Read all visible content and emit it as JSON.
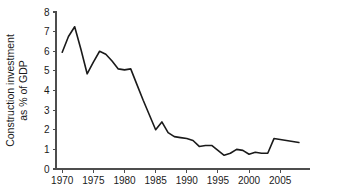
{
  "chart_data": {
    "type": "line",
    "title": "",
    "xlabel": "",
    "ylabel": "Construction investment as % of GDP",
    "ylabel_line1": "Construction investment",
    "ylabel_line2": "as % of GDP",
    "xlim": [
      1969,
      2008.5
    ],
    "ylim": [
      0,
      8
    ],
    "grid": false,
    "legend": "none",
    "ytick_labels": [
      "8",
      "7",
      "6",
      "5",
      "4",
      "3",
      "2",
      "1",
      "0"
    ],
    "ytick_values": [
      8,
      7,
      6,
      5,
      4,
      3,
      2,
      1,
      0
    ],
    "xtick_labels": [
      "1970",
      "1975",
      "1980",
      "1985",
      "1990",
      "1995",
      "2000",
      "2005"
    ],
    "xtick_values": [
      1970,
      1975,
      1980,
      1985,
      1990,
      1995,
      2000,
      2005
    ],
    "series": [
      {
        "name": "Construction investment as % of GDP",
        "color": "#1a1a1a",
        "x": [
          1970,
          1971,
          1972,
          1973,
          1974,
          1975,
          1976,
          1977,
          1978,
          1979,
          1980,
          1981,
          1982,
          1983,
          1984,
          1985,
          1986,
          1987,
          1988,
          1989,
          1990,
          1991,
          1992,
          1993,
          1994,
          1995,
          1996,
          1997,
          1998,
          1999,
          2000,
          2001,
          2002,
          2003,
          2004,
          2005,
          2006,
          2007,
          2008
        ],
        "values": [
          5.95,
          6.75,
          7.25,
          6.1,
          4.85,
          5.45,
          6.0,
          5.85,
          5.5,
          5.1,
          5.05,
          5.1,
          4.3,
          3.5,
          2.75,
          2.0,
          2.4,
          1.85,
          1.65,
          1.6,
          1.55,
          1.45,
          1.15,
          1.2,
          1.2,
          0.95,
          0.7,
          0.8,
          1.0,
          0.95,
          0.75,
          0.85,
          0.8,
          0.8,
          1.55,
          1.5,
          1.45,
          1.4,
          1.35
        ]
      }
    ]
  }
}
